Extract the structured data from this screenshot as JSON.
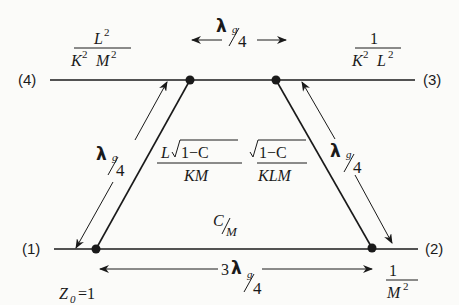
{
  "ports": {
    "p1": "(1)",
    "p2": "(2)",
    "p3": "(3)",
    "p4": "(4)"
  },
  "impedances": {
    "port4": {
      "num": "L",
      "num_sup": "2",
      "den_a": "K",
      "den_a_sup": "2",
      "den_b": "M",
      "den_b_sup": "2"
    },
    "port3": {
      "num": "1",
      "den_a": "K",
      "den_a_sup": "2",
      "den_b": "L",
      "den_b_sup": "2"
    },
    "port2": {
      "num": "1",
      "den": "M",
      "den_sup": "2"
    },
    "port1": {
      "z": "Z",
      "z_sub": "0",
      "eq": "=1"
    }
  },
  "branches": {
    "left": {
      "num_l": "L",
      "num_root": "1−C",
      "den": "KM"
    },
    "right": {
      "num_root": "1−C",
      "den": "KLM"
    },
    "bottom": {
      "num": "C",
      "den": "M"
    }
  },
  "dimensions": {
    "lambda": "λ",
    "g": "g",
    "four": "4",
    "three": "3",
    "top": "λ g/4",
    "left": "λ g/4",
    "right": "λ g/4",
    "bottom": "3λ g/4"
  },
  "colors": {
    "ink": "#1a1a1a",
    "paper": "#fbfbf9"
  }
}
